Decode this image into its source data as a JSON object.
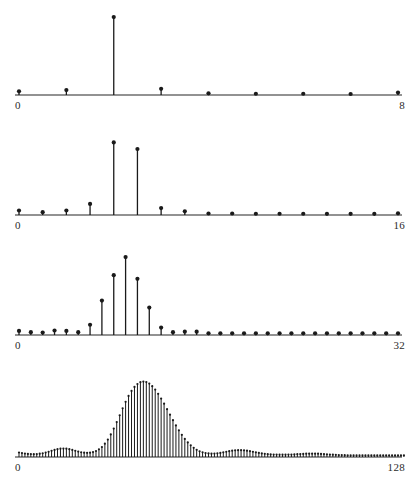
{
  "figure": {
    "title": "",
    "background_color": "#ffffff",
    "ink_color": "#1a1a1a",
    "axis_color": "#6e6e6e",
    "label_color": "#2b2b2b",
    "width": 417,
    "height": 483,
    "panel_count": 4
  },
  "chart_data": [
    {
      "type": "bar",
      "panel_index": 0,
      "name": "8-point-spectrum",
      "title": "",
      "xlabel": "",
      "ylabel": "",
      "grid": false,
      "legend": null,
      "xlim": [
        0,
        8
      ],
      "ylim": [
        0,
        1
      ],
      "xtick_labels": [
        "0",
        "8"
      ],
      "xtick_values": [
        0,
        8
      ],
      "marker": "filled-circle",
      "stem_style": "vertical-line-with-dot",
      "x": [
        0,
        1,
        2,
        3,
        4,
        5,
        6,
        7,
        8
      ],
      "values": [
        0.045,
        0.06,
        0.95,
        0.075,
        0.02,
        0.015,
        0.015,
        0.012,
        0.03
      ]
    },
    {
      "type": "bar",
      "panel_index": 1,
      "name": "16-point-spectrum",
      "title": "",
      "xlabel": "",
      "ylabel": "",
      "grid": false,
      "legend": null,
      "xlim": [
        0,
        16
      ],
      "ylim": [
        0,
        1
      ],
      "xtick_labels": [
        "0",
        "16"
      ],
      "xtick_values": [
        0,
        16
      ],
      "marker": "filled-circle",
      "stem_style": "vertical-line-with-dot",
      "x": [
        0,
        1,
        2,
        3,
        4,
        5,
        6,
        7,
        8,
        9,
        10,
        11,
        12,
        13,
        14,
        15,
        16
      ],
      "values": [
        0.055,
        0.035,
        0.055,
        0.135,
        0.885,
        0.805,
        0.085,
        0.045,
        0.018,
        0.018,
        0.015,
        0.015,
        0.015,
        0.014,
        0.014,
        0.014,
        0.02
      ]
    },
    {
      "type": "bar",
      "panel_index": 2,
      "name": "32-point-spectrum",
      "title": "",
      "xlabel": "",
      "ylabel": "",
      "grid": false,
      "legend": null,
      "xlim": [
        0,
        32
      ],
      "ylim": [
        0,
        1
      ],
      "xtick_labels": [
        "0",
        "32"
      ],
      "xtick_values": [
        0,
        32
      ],
      "marker": "filled-circle",
      "stem_style": "vertical-line-with-dot",
      "x": [
        0,
        1,
        2,
        3,
        4,
        5,
        6,
        7,
        8,
        9,
        10,
        11,
        12,
        13,
        14,
        15,
        16,
        17,
        18,
        19,
        20,
        21,
        22,
        23,
        24,
        25,
        26,
        27,
        28,
        29,
        30,
        31,
        32
      ],
      "values": [
        0.05,
        0.035,
        0.03,
        0.055,
        0.05,
        0.035,
        0.125,
        0.42,
        0.73,
        0.95,
        0.685,
        0.335,
        0.09,
        0.035,
        0.04,
        0.04,
        0.02,
        0.02,
        0.02,
        0.02,
        0.02,
        0.02,
        0.02,
        0.02,
        0.02,
        0.02,
        0.02,
        0.02,
        0.02,
        0.02,
        0.02,
        0.02,
        0.02
      ]
    },
    {
      "type": "bar",
      "panel_index": 3,
      "name": "128-point-spectrum",
      "title": "",
      "xlabel": "",
      "ylabel": "",
      "grid": false,
      "legend": null,
      "xlim": [
        0,
        128
      ],
      "ylim": [
        0,
        1
      ],
      "xtick_labels": [
        "0",
        "128"
      ],
      "xtick_values": [
        0,
        128
      ],
      "marker": "filled-circle",
      "stem_style": "vertical-line-with-dot",
      "x": [
        0,
        1,
        2,
        3,
        4,
        5,
        6,
        7,
        8,
        9,
        10,
        11,
        12,
        13,
        14,
        15,
        16,
        17,
        18,
        19,
        20,
        21,
        22,
        23,
        24,
        25,
        26,
        27,
        28,
        29,
        30,
        31,
        32,
        33,
        34,
        35,
        36,
        37,
        38,
        39,
        40,
        41,
        42,
        43,
        44,
        45,
        46,
        47,
        48,
        49,
        50,
        51,
        52,
        53,
        54,
        55,
        56,
        57,
        58,
        59,
        60,
        61,
        62,
        63,
        64,
        65,
        66,
        67,
        68,
        69,
        70,
        71,
        72,
        73,
        74,
        75,
        76,
        77,
        78,
        79,
        80,
        81,
        82,
        83,
        84,
        85,
        86,
        87,
        88,
        89,
        90,
        91,
        92,
        93,
        94,
        95,
        96,
        97,
        98,
        99,
        100,
        101,
        102,
        103,
        104,
        105,
        106,
        107,
        108,
        109,
        110,
        111,
        112,
        113,
        114,
        115,
        116,
        117,
        118,
        119,
        120,
        121,
        122,
        123,
        124,
        125,
        126,
        127,
        128
      ],
      "values": [
        0.055,
        0.048,
        0.042,
        0.038,
        0.036,
        0.035,
        0.036,
        0.04,
        0.046,
        0.054,
        0.064,
        0.075,
        0.086,
        0.095,
        0.101,
        0.103,
        0.101,
        0.095,
        0.086,
        0.076,
        0.066,
        0.058,
        0.053,
        0.051,
        0.053,
        0.06,
        0.073,
        0.093,
        0.122,
        0.162,
        0.213,
        0.275,
        0.347,
        0.426,
        0.509,
        0.593,
        0.673,
        0.745,
        0.806,
        0.855,
        0.89,
        0.912,
        0.92,
        0.914,
        0.895,
        0.864,
        0.822,
        0.771,
        0.713,
        0.65,
        0.583,
        0.516,
        0.449,
        0.385,
        0.325,
        0.27,
        0.221,
        0.178,
        0.142,
        0.112,
        0.088,
        0.07,
        0.057,
        0.048,
        0.043,
        0.041,
        0.042,
        0.045,
        0.05,
        0.057,
        0.064,
        0.071,
        0.077,
        0.081,
        0.083,
        0.083,
        0.081,
        0.077,
        0.071,
        0.064,
        0.057,
        0.05,
        0.044,
        0.039,
        0.035,
        0.032,
        0.03,
        0.029,
        0.028,
        0.028,
        0.028,
        0.029,
        0.03,
        0.032,
        0.034,
        0.036,
        0.038,
        0.04,
        0.041,
        0.041,
        0.041,
        0.04,
        0.038,
        0.036,
        0.033,
        0.03,
        0.028,
        0.026,
        0.024,
        0.023,
        0.022,
        0.021,
        0.021,
        0.021,
        0.021,
        0.021,
        0.021,
        0.021,
        0.021,
        0.021,
        0.021,
        0.021,
        0.021,
        0.021,
        0.021,
        0.021,
        0.021,
        0.021,
        0.021,
        0.021,
        0.021
      ]
    }
  ],
  "panels": [
    {
      "left_label": "0",
      "right_label": "8"
    },
    {
      "left_label": "0",
      "right_label": "16"
    },
    {
      "left_label": "0",
      "right_label": "32"
    },
    {
      "left_label": "0",
      "right_label": "128"
    }
  ]
}
